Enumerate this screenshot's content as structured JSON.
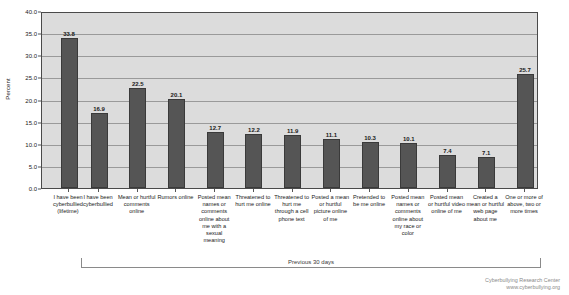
{
  "chart_data": {
    "type": "bar",
    "title": "",
    "xlabel": "",
    "ylabel": "Percent",
    "ylim": [
      0,
      40
    ],
    "ytick_step": 5,
    "ytick_labels": [
      "0.0",
      "5.0",
      "10.0",
      "15.0",
      "20.0",
      "25.0",
      "30.0",
      "35.0",
      "40.0"
    ],
    "grid": true,
    "legend": "none",
    "bar_color": "#555555",
    "plot_background": "#dcdcdc",
    "categories": [
      "I have been cyberbullied (lifetime)",
      "I have been cyberbullied",
      "Mean or hurtful comments online",
      "Rumors online",
      "Posted mean names or comments online about me with a sexual meaning",
      "Threatened to hurt me online",
      "Threatened to hurt me through a cell phone text",
      "Posted a mean or hurtful picture online of me",
      "Pretended to be me online",
      "Posted mean names or comments online about my race or color",
      "Posted mean or hurtful video online of me",
      "Created a mean or hurtful web page about me",
      "One or more of above, two or more times"
    ],
    "values": [
      33.8,
      16.9,
      22.5,
      20.1,
      12.7,
      12.2,
      11.9,
      11.1,
      10.3,
      10.1,
      7.4,
      7.1,
      25.7
    ],
    "value_labels": [
      "33.8",
      "16.9",
      "22.5",
      "20.1",
      "12.7",
      "12.2",
      "11.9",
      "11.1",
      "10.3",
      "10.1",
      "7.4",
      "7.1",
      "25.7"
    ],
    "annotations": [
      {
        "text": "Previous 30 days",
        "covers_categories": [
          1,
          12
        ]
      }
    ]
  },
  "credit": {
    "organization": "Cyberbullying Research Center",
    "website": "www.cyberbullying.org"
  }
}
